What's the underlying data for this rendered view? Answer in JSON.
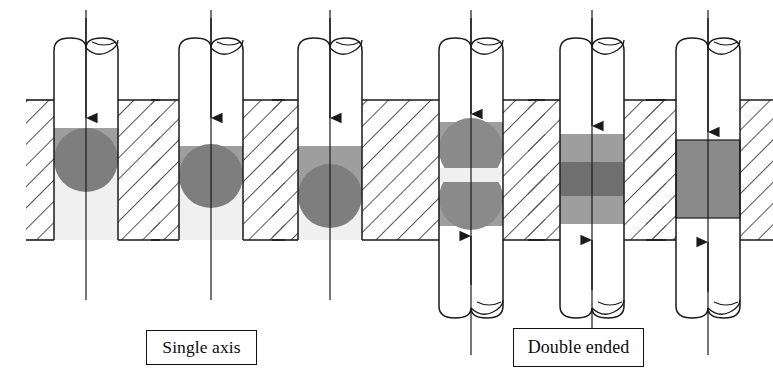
{
  "figure": {
    "title": "",
    "kind": "engineering-cross-section-diagram",
    "background_color": "#ffffff",
    "line_color": "#1a1a1a"
  },
  "labels": {
    "single_axis": "Single axis",
    "double_ended": "Double ended"
  },
  "palette": {
    "outline": "#1a1a1a",
    "hatch_line": "#555555",
    "fill_white": "#ffffff",
    "fill_very_light": "#f0f0f0",
    "fill_light_gray": "#a8a8a8",
    "fill_mid_gray": "#8d8d8d",
    "fill_dark_gray": "#777777",
    "block_face": "#ffffff"
  },
  "geometry": {
    "block_top_y": 100,
    "block_bottom_y": 240,
    "shaft_width": 64,
    "columns_x_center": [
      86,
      211,
      330,
      471,
      592,
      708
    ]
  },
  "columns": [
    {
      "index": 1,
      "group": "single-axis",
      "name": "single-axis-stage-1",
      "arrow_top": true,
      "arrow_bottom": false,
      "shaft_top_y": 38,
      "shaft_bottom_y": 240,
      "band_top_y": 128,
      "band_bottom_y": 160,
      "dome_center_y": 160,
      "dome_radius": 32,
      "below_fill": "very-light",
      "penetration": "shallow"
    },
    {
      "index": 2,
      "group": "single-axis",
      "name": "single-axis-stage-2",
      "arrow_top": true,
      "arrow_bottom": false,
      "shaft_top_y": 38,
      "shaft_bottom_y": 240,
      "band_top_y": 146,
      "band_bottom_y": 176,
      "dome_center_y": 176,
      "dome_radius": 32,
      "below_fill": "very-light",
      "penetration": "medium"
    },
    {
      "index": 3,
      "group": "single-axis",
      "name": "single-axis-stage-3",
      "arrow_top": true,
      "arrow_bottom": false,
      "shaft_top_y": 38,
      "shaft_bottom_y": 240,
      "band_top_y": 146,
      "band_bottom_y": 196,
      "dome_center_y": 196,
      "dome_radius": 32,
      "below_fill": "very-light",
      "penetration": "deep"
    },
    {
      "index": 4,
      "group": "double-ended",
      "name": "double-ended-stage-1",
      "arrow_top": true,
      "arrow_bottom": true,
      "shaft_top_y": 38,
      "shaft_bottom_y": 318,
      "upper_band_top_y": 122,
      "upper_dome_center_y": 150,
      "lower_band_bottom_y": 226,
      "lower_dome_center_y": 198,
      "dome_radius": 32,
      "gap_fill": "very-light",
      "penetration": "separated"
    },
    {
      "index": 5,
      "group": "double-ended",
      "name": "double-ended-stage-2",
      "arrow_top": true,
      "arrow_bottom": true,
      "shaft_top_y": 38,
      "shaft_bottom_y": 318,
      "upper_band_top_y": 134,
      "upper_dome_center_y": 172,
      "lower_band_bottom_y": 224,
      "lower_dome_center_y": 186,
      "dome_radius": 32,
      "gap_fill": "none",
      "penetration": "overlapping"
    },
    {
      "index": 6,
      "group": "double-ended",
      "name": "double-ended-stage-3",
      "arrow_top": true,
      "arrow_bottom": true,
      "shaft_top_y": 38,
      "shaft_bottom_y": 318,
      "band_top_y": 140,
      "band_bottom_y": 218,
      "gap_fill": "none",
      "penetration": "uniform-full"
    }
  ]
}
